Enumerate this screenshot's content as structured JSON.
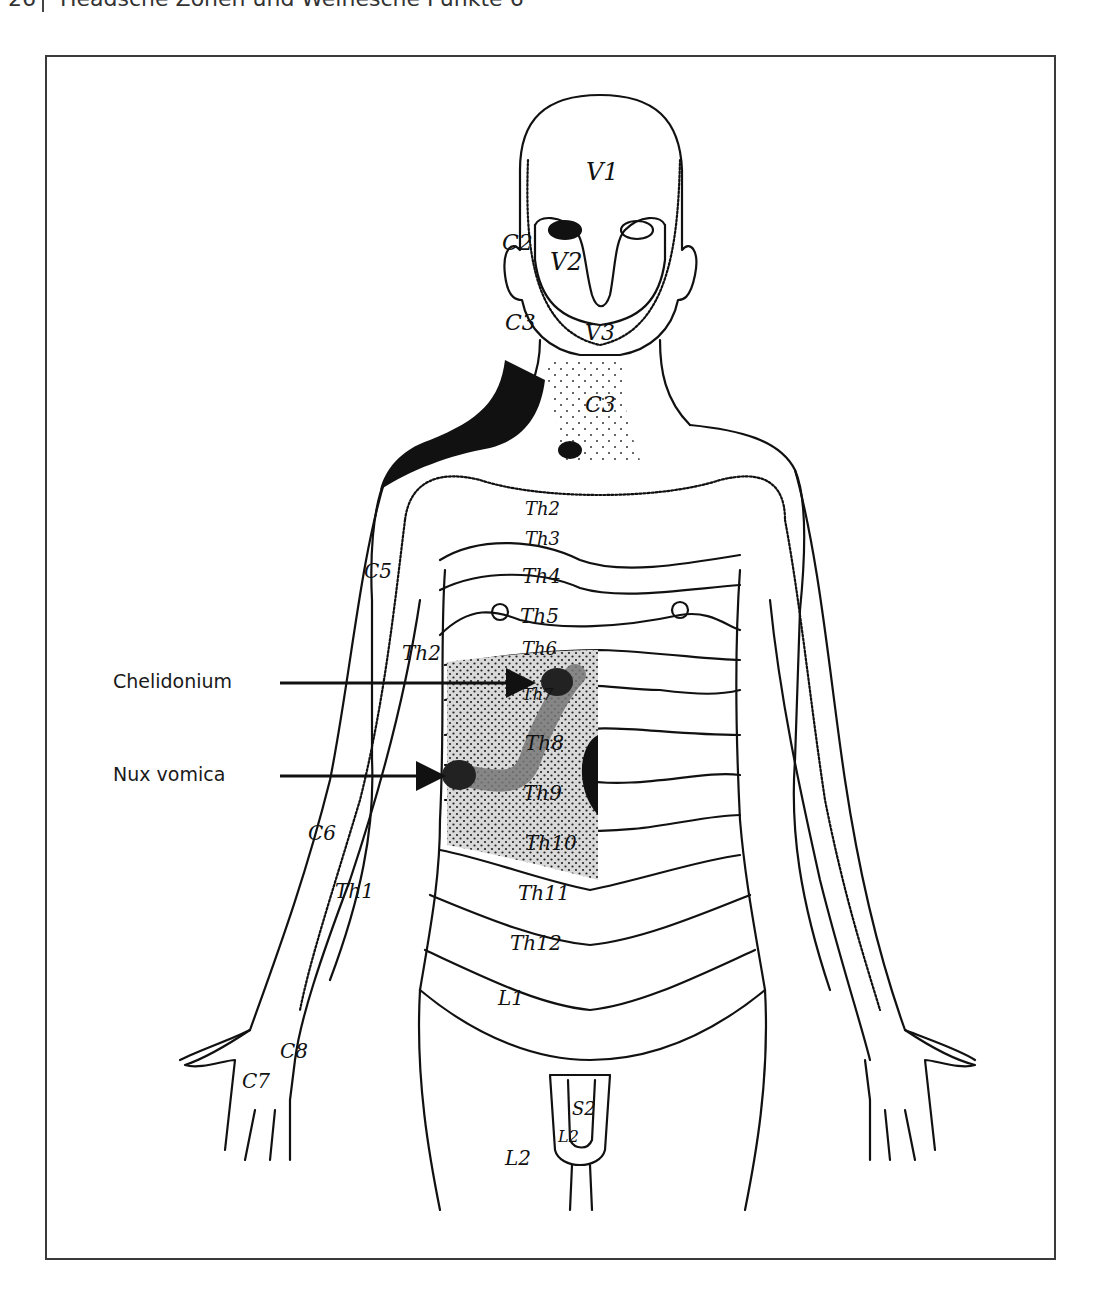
{
  "page": {
    "number": "26",
    "running_title": "Headsche Zonen und Weihesche Punkte 6"
  },
  "figure": {
    "callouts": [
      {
        "label": "Chelidonium",
        "icon": "arrow-right-icon"
      },
      {
        "label": "Nux vomica",
        "icon": "arrow-right-icon"
      }
    ],
    "zone_labels": {
      "v1": "V1",
      "v2": "V2",
      "v3": "V3",
      "c2": "C2",
      "c3_neck": "C3",
      "c3_chest": "C3",
      "c5": "C5",
      "c6": "C6",
      "c7": "C7",
      "c8": "C8",
      "th1": "Th1",
      "th2_arm": "Th2",
      "th2": "Th2",
      "th3": "Th3",
      "th4": "Th4",
      "th5": "Th5",
      "th6": "Th6",
      "th7": "Th7",
      "th8": "Th8",
      "th9": "Th9",
      "th10": "Th10",
      "th11": "Th11",
      "th12": "Th12",
      "l1": "L1",
      "l2": "L2",
      "l2_genital": "L2",
      "s2": "S2"
    },
    "colors": {
      "line": "#111111",
      "stipple_zone": "#d6d6d6",
      "dark_point": "#2a2a2a",
      "gall_band": "#8a8a8a"
    }
  }
}
